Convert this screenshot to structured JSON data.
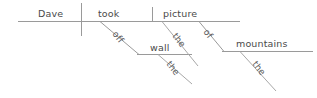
{
  "diagram": {
    "kind": "reed-kellogg-sentence-diagram",
    "sentence": "Dave took the picture off the wall of the mountains",
    "canvas": {
      "width": 317,
      "height": 98
    },
    "colors": {
      "background": "#ffffff",
      "line": "#9a9a9a",
      "text": "#4a4a4a"
    },
    "words": {
      "subject": "Dave",
      "verb": "took",
      "direct_object": "picture",
      "article_object": "the",
      "preposition_one": "off",
      "object_of_prep_one": "wall",
      "article_wall": "the",
      "preposition_two": "of",
      "object_of_prep_two": "mountains",
      "article_mountains": "the"
    },
    "labels": {
      "subject_pos": {
        "x": 38,
        "y": 17
      },
      "verb_pos": {
        "x": 98,
        "y": 17
      },
      "object_pos": {
        "x": 163,
        "y": 17
      },
      "prep_one_pos": {
        "x": 113,
        "y": 40,
        "rotate": 52
      },
      "wall_pos": {
        "x": 151,
        "y": 50
      },
      "article_picture_pos": {
        "x": 176,
        "y": 41,
        "rotate": 52
      },
      "article_wall_pos": {
        "x": 165,
        "y": 70,
        "rotate": 52
      },
      "prep_two_pos": {
        "x": 205,
        "y": 39,
        "rotate": 52
      },
      "mountains_pos": {
        "x": 238,
        "y": 47
      },
      "article_mountains_pos": {
        "x": 253,
        "y": 73,
        "rotate": 52
      }
    },
    "strokes": {
      "baseline": {
        "x1": 18,
        "y1": 21,
        "x2": 240,
        "y2": 21
      },
      "subject_verb_divider": {
        "x1": 81,
        "y1": 3,
        "x2": 81,
        "y2": 36
      },
      "object_divider": {
        "x1": 152,
        "y1": 7,
        "x2": 152,
        "y2": 21
      },
      "prep_one_diagonal": {
        "x1": 100,
        "y1": 21,
        "x2": 139,
        "y2": 54
      },
      "wall_baseline": {
        "x1": 137,
        "y1": 54,
        "x2": 192,
        "y2": 54
      },
      "article_picture_diagonal": {
        "x1": 162,
        "y1": 21,
        "x2": 198,
        "y2": 66
      },
      "article_wall_diagonal": {
        "x1": 158,
        "y1": 54,
        "x2": 192,
        "y2": 84
      },
      "prep_two_diagonal": {
        "x1": 199,
        "y1": 21,
        "x2": 224,
        "y2": 51
      },
      "mountains_baseline": {
        "x1": 222,
        "y1": 51,
        "x2": 313,
        "y2": 51
      },
      "article_mountains_diagonal": {
        "x1": 240,
        "y1": 51,
        "x2": 276,
        "y2": 91
      }
    }
  }
}
